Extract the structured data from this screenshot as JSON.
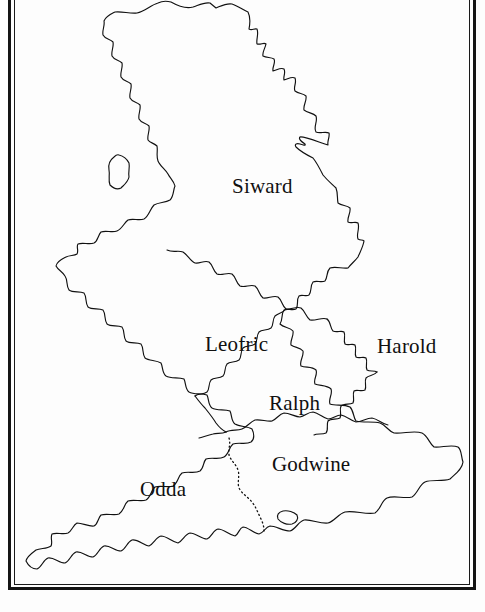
{
  "map": {
    "kind": "historical-outline-map",
    "region_outline": "England and Wales coastline with Isle of Man",
    "frame": {
      "style": "double-line rectangular border",
      "color": "#141414"
    },
    "colors": {
      "background": "#fdfdfd",
      "ink": "#111111",
      "label_text": "#101010"
    },
    "labels": [
      {
        "name": "Siward",
        "x": 232,
        "y": 176,
        "note": "northern earldom label"
      },
      {
        "name": "Leofric",
        "x": 205,
        "y": 334,
        "note": "midlands earldom label"
      },
      {
        "name": "Harold",
        "x": 377,
        "y": 336,
        "note": "east anglia earldom label"
      },
      {
        "name": "Ralph",
        "x": 269,
        "y": 393,
        "note": "central earldom label"
      },
      {
        "name": "Godwine",
        "x": 272,
        "y": 454,
        "note": "southeast earldom label"
      },
      {
        "name": "Odda",
        "x": 140,
        "y": 479,
        "note": "southwest earldom label"
      }
    ],
    "boundaries": {
      "solid_count": 6,
      "dotted_count": 1,
      "dotted_note": "dotted line divides Odda from Godwine in the south"
    }
  }
}
